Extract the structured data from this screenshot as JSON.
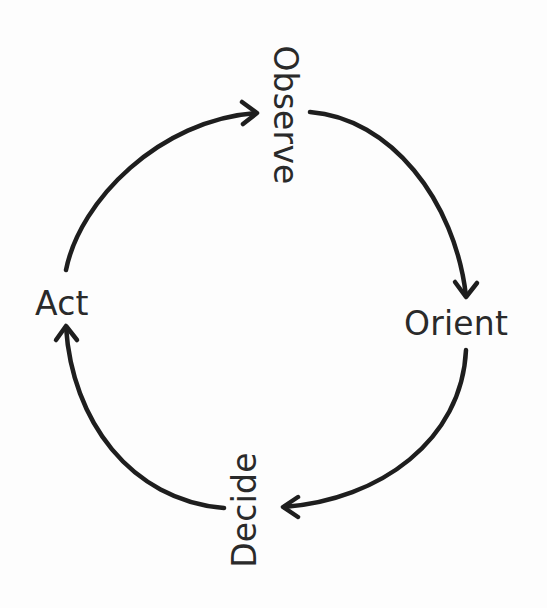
{
  "diagram": {
    "type": "cycle",
    "title": "",
    "nodes": [
      {
        "id": "observe",
        "label": "Observe",
        "orientation": "rotated-90-cw"
      },
      {
        "id": "orient",
        "label": "Orient",
        "orientation": "horizontal"
      },
      {
        "id": "decide",
        "label": "Decide",
        "orientation": "rotated-90-ccw"
      },
      {
        "id": "act",
        "label": "Act",
        "orientation": "horizontal"
      }
    ],
    "edges": [
      {
        "from": "observe",
        "to": "orient",
        "direction": "clockwise"
      },
      {
        "from": "orient",
        "to": "decide",
        "direction": "clockwise"
      },
      {
        "from": "decide",
        "to": "act",
        "direction": "clockwise"
      },
      {
        "from": "act",
        "to": "observe",
        "direction": "clockwise"
      }
    ],
    "colors": {
      "stroke": "#1e1e1e",
      "text": "#2a2a2a",
      "background": "#fdfdfd"
    }
  }
}
